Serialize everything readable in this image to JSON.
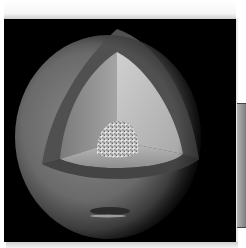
{
  "image": {
    "subject": "planet-interior-cutaway",
    "description": "Grayscale cutaway sphere of a gas giant showing outer atmosphere, mantle layer and rocky core",
    "layers": [
      "outer-atmosphere",
      "shell",
      "mantle",
      "core"
    ],
    "colors": {
      "background": "#000000",
      "page": "#ffffff",
      "outer": "#6f6f6f",
      "shell": "#4a4a4a",
      "mantle_left": "#9a9a9a",
      "mantle_right": "#c4c4c4",
      "mantle_floor": "#b0b0b0",
      "core": "#d8d8d8",
      "side_bar": "#9a9a9a"
    }
  }
}
